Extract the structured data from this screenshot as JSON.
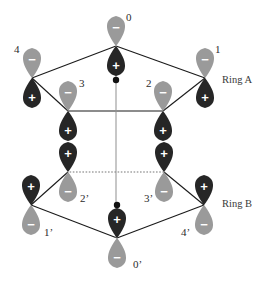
{
  "figure": {
    "type": "orbital-diagram",
    "background_color": "#ffffff"
  },
  "colors": {
    "positive_lobe": "#262626",
    "negative_lobe": "#9a9a9a",
    "negative_lobe_light": "#a8a8a8",
    "sign_text": "#ffffff",
    "bond": "#1a1a1a",
    "hidden_bond": "#777777",
    "axis": "#8f8f8f",
    "center_dot": "#111111",
    "label_text": "#2b2b2b"
  },
  "ring_labels": [
    {
      "name": "ring-a-label",
      "text": "Ring A",
      "x": 222,
      "y": 75
    },
    {
      "name": "ring-b-label",
      "text": "Ring B",
      "x": 222,
      "y": 199
    }
  ],
  "signs": {
    "positive": "+",
    "negative": "−"
  },
  "rings": [
    {
      "id": "A",
      "label": "Ring A",
      "orientation": "negative-lobe-up",
      "center": {
        "x": 116,
        "y": 80
      },
      "orbitals": [
        {
          "id": "0",
          "label": "0",
          "x": 116,
          "y": 46,
          "top_sign": "−",
          "bottom_sign": "+",
          "top_color": "negative",
          "bottom_color": "positive",
          "label_x": 126,
          "label_y": 12
        },
        {
          "id": "1",
          "label": "1",
          "x": 205,
          "y": 78,
          "top_sign": "−",
          "bottom_sign": "+",
          "top_color": "negative",
          "bottom_color": "positive",
          "label_x": 215,
          "label_y": 44
        },
        {
          "id": "2",
          "label": "2",
          "x": 163,
          "y": 111,
          "top_sign": "−",
          "bottom_sign": "+",
          "top_color": "negative",
          "bottom_color": "positive",
          "label_x": 146,
          "label_y": 78
        },
        {
          "id": "3",
          "label": "3",
          "x": 68,
          "y": 111,
          "top_sign": "−",
          "bottom_sign": "+",
          "top_color": "negative",
          "bottom_color": "positive",
          "label_x": 79,
          "label_y": 78
        },
        {
          "id": "4",
          "label": "4",
          "x": 32,
          "y": 78,
          "top_sign": "−",
          "bottom_sign": "+",
          "top_color": "negative",
          "bottom_color": "positive",
          "label_x": 14,
          "label_y": 44
        }
      ],
      "bonds": [
        {
          "from": "4",
          "to": "0",
          "style": "solid"
        },
        {
          "from": "0",
          "to": "1",
          "style": "solid"
        },
        {
          "from": "1",
          "to": "2",
          "style": "solid"
        },
        {
          "from": "2",
          "to": "3",
          "style": "solid"
        },
        {
          "from": "3",
          "to": "4",
          "style": "solid"
        }
      ]
    },
    {
      "id": "B",
      "label": "Ring B",
      "orientation": "positive-lobe-up",
      "center": {
        "x": 117,
        "y": 205
      },
      "orbitals": [
        {
          "id": "0p",
          "label": "0’",
          "x": 117,
          "y": 238,
          "top_sign": "+",
          "bottom_sign": "−",
          "top_color": "positive",
          "bottom_color": "negative",
          "label_x": 133,
          "label_y": 259
        },
        {
          "id": "1p",
          "label": "1’",
          "x": 31,
          "y": 205,
          "top_sign": "+",
          "bottom_sign": "−",
          "top_color": "positive",
          "bottom_color": "negative",
          "label_x": 44,
          "label_y": 227
        },
        {
          "id": "2p",
          "label": "2’",
          "x": 68,
          "y": 172,
          "top_sign": "+",
          "bottom_sign": "−",
          "top_color": "positive",
          "bottom_color": "negative",
          "label_x": 80,
          "label_y": 193
        },
        {
          "id": "3p",
          "label": "3’",
          "x": 164,
          "y": 172,
          "top_sign": "+",
          "bottom_sign": "−",
          "top_color": "positive",
          "bottom_color": "negative",
          "label_x": 144,
          "label_y": 193
        },
        {
          "id": "4p",
          "label": "4’",
          "x": 204,
          "y": 205,
          "top_sign": "+",
          "bottom_sign": "−",
          "top_color": "positive",
          "bottom_color": "negative",
          "label_x": 181,
          "label_y": 227
        }
      ],
      "bonds": [
        {
          "from": "1p",
          "to": "0p",
          "style": "solid"
        },
        {
          "from": "0p",
          "to": "4p",
          "style": "solid"
        },
        {
          "from": "4p",
          "to": "3p",
          "style": "solid"
        },
        {
          "from": "3p",
          "to": "2p",
          "style": "dotted"
        },
        {
          "from": "2p",
          "to": "1p",
          "style": "solid"
        }
      ]
    }
  ],
  "axis": {
    "name": "vertical-symmetry-axis",
    "x": 116,
    "y1": 46,
    "y2": 238,
    "style": "thin-gray"
  }
}
